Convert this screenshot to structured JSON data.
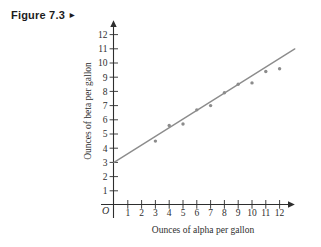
{
  "figure": {
    "label": "Figure 7.3",
    "marker": "►"
  },
  "chart_data": {
    "type": "scatter",
    "title": "",
    "xlabel": "Ounces of alpha per gallon",
    "ylabel": "Ounces of beta per gallon",
    "origin_label": "O",
    "grid": false,
    "xlim": [
      0,
      13.5
    ],
    "ylim": [
      0,
      13
    ],
    "x_ticks": [
      1,
      2,
      3,
      4,
      5,
      6,
      7,
      8,
      9,
      10,
      11,
      12
    ],
    "y_ticks": [
      1,
      2,
      3,
      4,
      5,
      6,
      7,
      8,
      9,
      10,
      11,
      12
    ],
    "points": [
      [
        3,
        4.5
      ],
      [
        4,
        5.6
      ],
      [
        5,
        5.7
      ],
      [
        6,
        6.7
      ],
      [
        7,
        7.0
      ],
      [
        8,
        7.9
      ],
      [
        9,
        8.5
      ],
      [
        10,
        8.6
      ],
      [
        11,
        9.4
      ],
      [
        12,
        9.6
      ]
    ],
    "trend_line": {
      "intercept": 3,
      "slope": 0.61,
      "x_start": 0,
      "x_end": 13.1
    },
    "colors": {
      "axis": "#2e2e2e",
      "tick_text": "#2e2e2e",
      "data": "#8c8c8c"
    }
  }
}
